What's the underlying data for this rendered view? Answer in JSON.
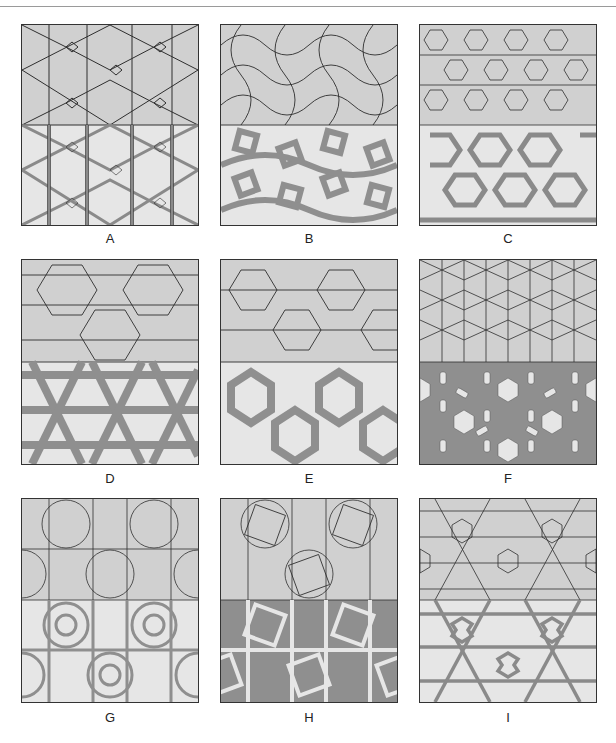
{
  "figure": {
    "header_caption": "Figure — Pattern types (construction lines above, interlaced rendering below)",
    "panels": [
      {
        "id": "A",
        "label": "A",
        "upper": "construction lines",
        "lower": "interlaced bands"
      },
      {
        "id": "B",
        "label": "B",
        "upper": "construction lines",
        "lower": "interlaced bands"
      },
      {
        "id": "C",
        "label": "C",
        "upper": "construction lines",
        "lower": "interlaced bands"
      },
      {
        "id": "D",
        "label": "D",
        "upper": "construction lines",
        "lower": "interlaced bands"
      },
      {
        "id": "E",
        "label": "E",
        "upper": "construction lines",
        "lower": "interlaced bands"
      },
      {
        "id": "F",
        "label": "F",
        "upper": "construction lines",
        "lower": "interlaced bands"
      },
      {
        "id": "G",
        "label": "G",
        "upper": "construction lines",
        "lower": "interlaced bands"
      },
      {
        "id": "H",
        "label": "H",
        "upper": "construction lines",
        "lower": "interlaced bands"
      },
      {
        "id": "I",
        "label": "I",
        "upper": "construction lines",
        "lower": "interlaced bands"
      }
    ],
    "colors": {
      "upper_fill": "#d0d0d0",
      "lower_fill": "#e6e6e6",
      "band_fill": "#9a9a9a",
      "line": "#2e2e2e",
      "frame": "#333333"
    }
  }
}
